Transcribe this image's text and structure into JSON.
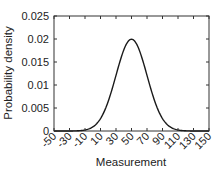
{
  "chart_data": {
    "type": "line",
    "title": "",
    "xlabel": "Measurement",
    "ylabel": "Probability density",
    "xlim": [
      -50,
      150
    ],
    "ylim": [
      0,
      0.025
    ],
    "x_ticks": [
      -50,
      -30,
      -10,
      10,
      30,
      50,
      70,
      90,
      110,
      130,
      150
    ],
    "x_tick_labels": [
      "-50",
      "-30",
      "-10",
      "10",
      "30",
      "50",
      "70",
      "90",
      "110",
      "130",
      "150"
    ],
    "y_ticks": [
      0,
      0.005,
      0.01,
      0.015,
      0.02,
      0.025
    ],
    "y_tick_labels": [
      "0",
      "0.005",
      "0.01",
      "0.015",
      "0.02",
      "0.025"
    ],
    "grid": false,
    "legend": null,
    "series": [
      {
        "name": "Normal PDF",
        "distribution": {
          "type": "normal",
          "mean": 50,
          "std": 20
        },
        "x": [
          -50,
          -30,
          -10,
          0,
          10,
          20,
          30,
          40,
          50,
          60,
          70,
          80,
          90,
          100,
          110,
          130,
          150
        ],
        "values": [
          0.0,
          0.0,
          0.0002,
          0.0009,
          0.0027,
          0.0065,
          0.0121,
          0.0176,
          0.0199,
          0.0176,
          0.0121,
          0.0065,
          0.0027,
          0.0009,
          0.0002,
          0.0,
          0.0
        ],
        "color": "#1a1a1a"
      }
    ]
  }
}
